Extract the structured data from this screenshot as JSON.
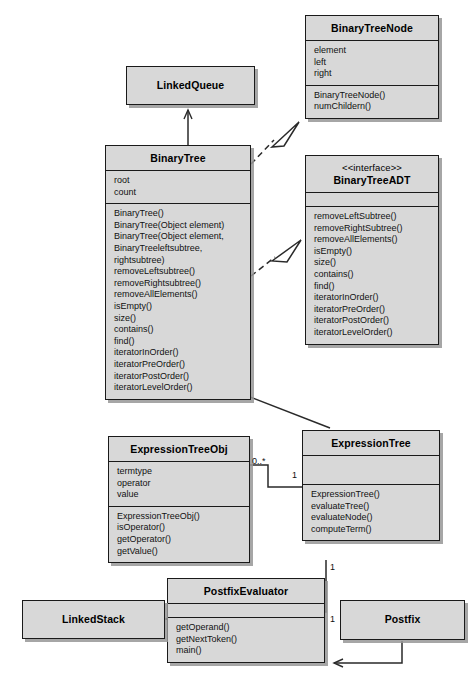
{
  "diagram": {
    "kind": "uml-class-diagram",
    "colors": {
      "box_fill": "#d8d8d8",
      "box_border": "#1a1a1a",
      "shadow": "#969696",
      "line": "#2a2a2a",
      "background": "#ffffff"
    }
  },
  "classes": {
    "binary_tree_node": {
      "name": "BinaryTreeNode",
      "attributes": [
        "element",
        "left",
        "right"
      ],
      "methods": [
        "BinaryTreeNode()",
        "numChildern()"
      ]
    },
    "linked_queue": {
      "name": "LinkedQueue",
      "attributes": [],
      "methods": []
    },
    "binary_tree": {
      "name": "BinaryTree",
      "attributes": [
        "root",
        "count"
      ],
      "methods": [
        "BinaryTree()",
        "BinaryTree(Object element)",
        "BinaryTree(Object element,",
        "BinaryTreeleftsubtree,",
        "rightsubtree)",
        "removeLeftsubtree()",
        "removeRightsubtree()",
        "removeAllElements()",
        "isEmpty()",
        "size()",
        "contains()",
        "find()",
        "iteratorInOrder()",
        "iteratorPreOrder()",
        "iteratorPostOrder()",
        "iteratorLevelOrder()"
      ]
    },
    "binary_tree_adt": {
      "stereotype": "<<interface>>",
      "name": "BinaryTreeADT",
      "attributes": [],
      "methods": [
        "removeLeftSubtree()",
        "removeRightSubtree()",
        "removeAllElements()",
        "isEmpty()",
        "size()",
        "contains()",
        "find()",
        "iteratorInOrder()",
        "iteratorPreOrder()",
        "iteratorPostOrder()",
        "iteratorLevelOrder()"
      ]
    },
    "expression_tree_obj": {
      "name": "ExpressionTreeObj",
      "attributes": [
        "termtype",
        "operator",
        "value"
      ],
      "methods": [
        "ExpressionTreeObj()",
        "isOperator()",
        "getOperator()",
        "getValue()"
      ]
    },
    "expression_tree": {
      "name": "ExpressionTree",
      "attributes": [],
      "methods": [
        "ExpressionTree()",
        "evaluateTree()",
        "evaluateNode()",
        "computeTerm()"
      ]
    },
    "postfix_evaluator": {
      "name": "PostfixEvaluator",
      "attributes": [],
      "methods": [
        "getOperand()",
        "getNextToken()",
        "main()"
      ]
    },
    "linked_stack": {
      "name": "LinkedStack",
      "attributes": [],
      "methods": []
    },
    "postfix": {
      "name": "Postfix",
      "attributes": [],
      "methods": []
    }
  },
  "multiplicities": {
    "expr_obj_to_tree_source": "0..*",
    "expr_obj_to_tree_target": "1",
    "expr_tree_to_evaluator": "1",
    "evaluator_to_expr_tree": "1"
  },
  "relationships": [
    {
      "name": "binarytree-realizes-binarytreenode",
      "from": "BinaryTree",
      "to": "BinaryTreeNode",
      "style": "dashed",
      "head": "hollow-triangle"
    },
    {
      "name": "binarytree-realizes-binarytreeadt",
      "from": "BinaryTree",
      "to": "BinaryTreeADT",
      "style": "dashed",
      "head": "hollow-triangle"
    },
    {
      "name": "binarytree-uses-linkedqueue",
      "from": "BinaryTree",
      "to": "LinkedQueue",
      "style": "solid",
      "head": "open-arrow"
    },
    {
      "name": "expressiontree-extends-binarytree",
      "from": "ExpressionTree",
      "to": "BinaryTree",
      "style": "solid",
      "head": "hollow-triangle"
    },
    {
      "name": "expressiontreeobj-associates-expressiontree",
      "from": "ExpressionTreeObj",
      "to": "ExpressionTree",
      "style": "solid",
      "head": "none"
    },
    {
      "name": "expressiontree-associates-postfixevaluator",
      "from": "ExpressionTree",
      "to": "PostfixEvaluator",
      "style": "solid",
      "head": "none"
    },
    {
      "name": "postfixevaluator-uses-linkedstack",
      "from": "PostfixEvaluator",
      "to": "LinkedStack",
      "style": "solid",
      "head": "open-arrow"
    },
    {
      "name": "postfix-uses-postfixevaluator",
      "from": "Postfix",
      "to": "PostfixEvaluator",
      "style": "solid",
      "head": "open-arrow"
    }
  ]
}
